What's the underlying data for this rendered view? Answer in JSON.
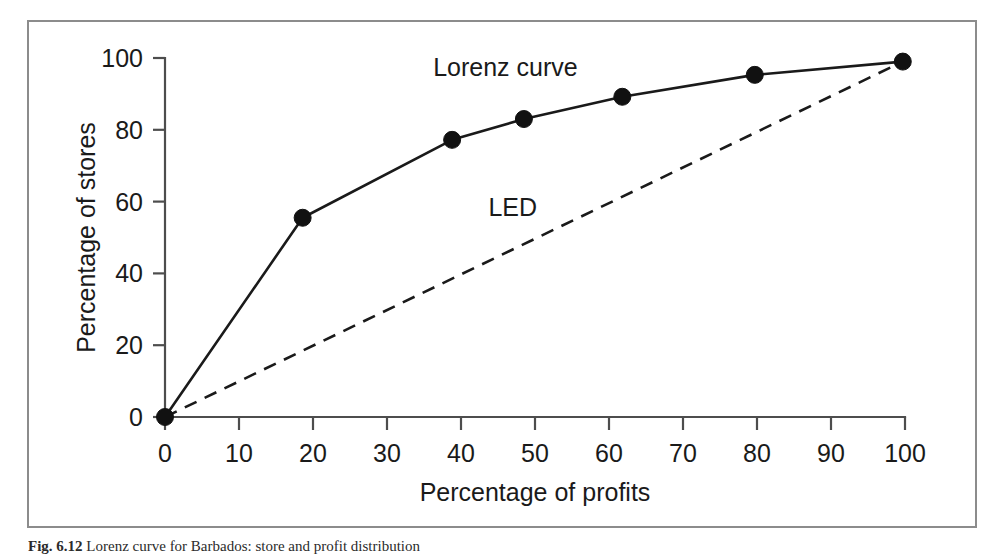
{
  "figure": {
    "caption_label": "Fig. 6.12",
    "caption_text": "Lorenz curve for Barbados: store and profit distribution"
  },
  "chart_data": {
    "type": "line",
    "title": "",
    "xlabel": "Percentage of profits",
    "ylabel": "Percentage of stores",
    "xlim": [
      0,
      100
    ],
    "ylim": [
      0,
      100
    ],
    "xticks": [
      0,
      10,
      20,
      30,
      40,
      50,
      60,
      70,
      80,
      90,
      100
    ],
    "yticks": [
      0,
      20,
      40,
      60,
      80,
      100
    ],
    "xtick_labels": [
      "0",
      "10",
      "20",
      "30",
      "40",
      "50",
      "60",
      "70",
      "80",
      "90",
      "100"
    ],
    "ytick_labels": [
      "0",
      "20",
      "40",
      "60",
      "80",
      "100"
    ],
    "grid": false,
    "legend_position": "inline-annotation",
    "series": [
      {
        "name": "Lorenz curve",
        "style": "solid",
        "markers": "filled-circle",
        "color": "#111111",
        "annotation": "Lorenz curve",
        "annotation_x": 46,
        "annotation_y": 95,
        "x": [
          0,
          18.6,
          38.8,
          48.5,
          61.8,
          79.7,
          99.7
        ],
        "y": [
          0,
          55.5,
          77.2,
          83.0,
          89.2,
          95.3,
          99.0
        ]
      },
      {
        "name": "LED",
        "style": "dashed",
        "markers": "none",
        "color": "#111111",
        "annotation": "LED",
        "annotation_x": 47,
        "annotation_y": 56,
        "x": [
          0,
          99.7
        ],
        "y": [
          0,
          99.0
        ]
      }
    ]
  }
}
